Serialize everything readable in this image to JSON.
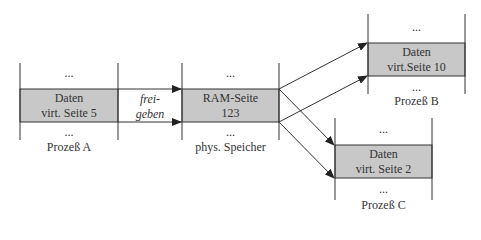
{
  "diagram": {
    "colors": {
      "box_fill": "#c8c8c8",
      "line": "#333333",
      "background": "#ffffff"
    },
    "ellipsis": "...",
    "process_a": {
      "line1": "Daten",
      "line2": "virt. Seite 5",
      "caption": "Prozeß A"
    },
    "ram": {
      "line1": "RAM-Seite",
      "line2": "123",
      "caption": "phys. Speicher"
    },
    "process_b": {
      "line1": "Daten",
      "line2": "virt.Seite 10",
      "caption": "Prozeß B"
    },
    "process_c": {
      "line1": "Daten",
      "line2": "virt. Seite 2",
      "caption": "Prozeß C"
    },
    "arrow_label": {
      "line1": "frei-",
      "line2": "geben"
    }
  }
}
